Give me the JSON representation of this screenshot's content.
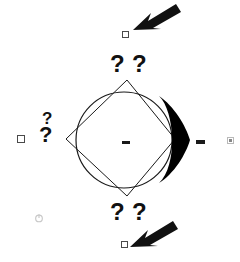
{
  "canvas": {
    "width": 240,
    "height": 262,
    "background": "#ffffff",
    "stroke_color": "#1a1a1a",
    "fill_color": "#000000",
    "muted_color": "#b9b9b9"
  },
  "shapes": {
    "diamond": {
      "name": "diamond-outline",
      "points": "127,80 175,139 127,196 66,139",
      "stroke": "#1a1a1a",
      "stroke_width": 1,
      "fill": "none"
    },
    "circle": {
      "name": "inscribed-circle",
      "cx": 124,
      "cy": 140,
      "r": 48,
      "stroke": "#1a1a1a",
      "stroke_width": 1.2,
      "fill": "none"
    },
    "black_wedge": {
      "name": "black-arrowhead-wedge",
      "fill": "#000000",
      "path": "M 160 97 C 176 112 178 165 160 182 C 178 170 188 150 190 140 C 188 128 176 108 160 97 Z"
    },
    "center_dash": {
      "label": "-",
      "name": "center-dash"
    },
    "right_dash": {
      "label": "-",
      "name": "right-dash"
    }
  },
  "question_marks": {
    "symbol": "?",
    "top": [
      "?",
      "?"
    ],
    "bottom": [
      "?",
      "?"
    ],
    "left": [
      "?",
      "?"
    ]
  },
  "cursors": [
    {
      "name": "cursor-arrow-top-right",
      "direction": "down-left",
      "x": 133,
      "y": 3
    },
    {
      "name": "cursor-arrow-bottom-right",
      "direction": "down-left",
      "x": 130,
      "y": 220
    }
  ],
  "handles": [
    {
      "name": "handle-top",
      "shape": "square-outline"
    },
    {
      "name": "handle-left",
      "shape": "square-outline"
    },
    {
      "name": "handle-bottom",
      "shape": "square-outline"
    },
    {
      "name": "marker-right",
      "shape": "small-gray-square"
    }
  ],
  "icons": {
    "power_glyph": "power-icon"
  }
}
